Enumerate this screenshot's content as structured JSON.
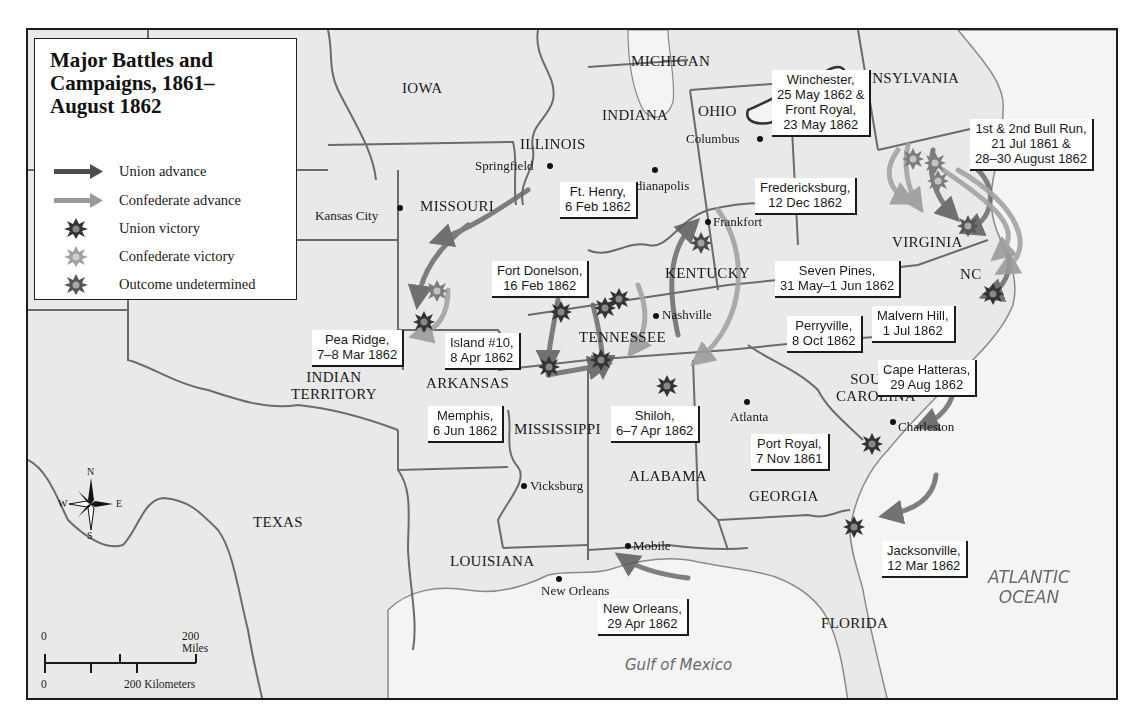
{
  "legend": {
    "title_line1": "Major Battles and",
    "title_line2": "Campaigns, 1861–",
    "title_line3": "August 1862",
    "items": [
      {
        "label": "Union advance",
        "symbol": "arrow",
        "color": "#4d4d4d"
      },
      {
        "label": "Confederate advance",
        "symbol": "arrow",
        "color": "#9a9a9a"
      },
      {
        "label": "Union victory",
        "symbol": "burst",
        "color": "#3a3a3a"
      },
      {
        "label": "Confederate victory",
        "symbol": "burst",
        "color": "#9c9c9c"
      },
      {
        "label": "Outcome undetermined",
        "symbol": "burst",
        "color": "#5e5e5e"
      }
    ]
  },
  "states": {
    "iowa": "IOWA",
    "michigan": "MICHIGAN",
    "pennsylvania": "PENNSYLVANIA",
    "ohio": "OHIO",
    "indiana": "INDIANA",
    "illinois": "ILLINOIS",
    "missouri": "MISSOURI",
    "kentucky": "KENTUCKY",
    "virginia": "VIRGINIA",
    "nc": "NC",
    "tennessee": "TENNESSEE",
    "indian_territory_1": "INDIAN",
    "indian_territory_2": "TERRITORY",
    "arkansas": "ARKANSAS",
    "south_carolina_1": "SOUTH",
    "south_carolina_2": "CAROLINA",
    "mississippi": "MISSISSIPPI",
    "alabama": "ALABAMA",
    "georgia": "GEORGIA",
    "texas": "TEXAS",
    "louisiana": "LOUISIANA",
    "florida": "FLORIDA"
  },
  "cities": {
    "springfield": "Springfield",
    "columbus": "Columbus",
    "indianapolis": "Indianapolis",
    "kansas_city": "Kansas City",
    "frankfort": "Frankfort",
    "nashville": "Nashville",
    "atlanta": "Atlanta",
    "charleston": "Charleston",
    "vicksburg": "Vicksburg",
    "mobile": "Mobile",
    "new_orleans": "New Orleans"
  },
  "water": {
    "atlantic_1": "ATLANTIC",
    "atlantic_2": "OCEAN",
    "gulf": "Gulf of Mexico"
  },
  "battles": {
    "winchester": {
      "name": "Winchester,",
      "date1": "25 May 1862 &",
      "name2": "Front Royal,",
      "date2": "23 May 1862"
    },
    "bull_run": {
      "name": "1st & 2nd Bull Run,",
      "date1": "21 Jul 1861 &",
      "date2": "28–30 August 1862"
    },
    "fredericksburg": {
      "name": "Fredericksburg,",
      "date": "12 Dec 1862"
    },
    "ft_henry": {
      "name": "Ft. Henry,",
      "date": "6 Feb 1862"
    },
    "fort_donelson": {
      "name": "Fort Donelson,",
      "date": "16 Feb 1862"
    },
    "seven_pines": {
      "name": "Seven Pines,",
      "date": "31 May–1 Jun 1862"
    },
    "malvern_hill": {
      "name": "Malvern Hill,",
      "date": "1 Jul 1862"
    },
    "perryville": {
      "name": "Perryville,",
      "date": "8 Oct 1862"
    },
    "cape_hatteras": {
      "name": "Cape Hatteras,",
      "date": "29 Aug 1862"
    },
    "pea_ridge": {
      "name": "Pea Ridge,",
      "date": "7–8 Mar 1862"
    },
    "island_10": {
      "name": "Island #10,",
      "date": "8 Apr 1862"
    },
    "memphis": {
      "name": "Memphis,",
      "date": "6 Jun 1862"
    },
    "shiloh": {
      "name": "Shiloh,",
      "date": "6–7 Apr 1862"
    },
    "port_royal": {
      "name": "Port Royal,",
      "date": "7 Nov 1861"
    },
    "jacksonville": {
      "name": "Jacksonville,",
      "date": "12 Mar 1862"
    },
    "new_orleans": {
      "name": "New Orleans,",
      "date": "29 Apr 1862"
    }
  },
  "compass": {
    "n": "N",
    "s": "S",
    "e": "E",
    "w": "W"
  },
  "scale": {
    "miles_zero": "0",
    "miles_label": "200 Miles",
    "km_zero": "0",
    "km_label": "200 Kilometers"
  },
  "colors": {
    "land": "#e9e9e9",
    "water": "#f4f4f4",
    "border": "#6b6b6b",
    "union": "#4d4d4d",
    "confederate": "#9a9a9a"
  }
}
